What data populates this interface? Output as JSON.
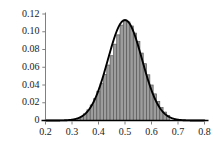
{
  "chart_data": {
    "type": "bar",
    "title": "",
    "subtitle": "",
    "xlabel": "",
    "ylabel": "",
    "xlim": [
      0.2,
      0.8
    ],
    "ylim": [
      0.0,
      0.12
    ],
    "grid": false,
    "legend": null,
    "xticks": [
      0.2,
      0.3,
      0.4,
      0.5,
      0.6,
      0.7,
      0.8
    ],
    "xtick_labels": [
      "0.2",
      "0.3",
      "0.4",
      "0.5",
      "0.6",
      "0.7",
      "0.8"
    ],
    "yticks": [
      0.0,
      0.02,
      0.04,
      0.06,
      0.08,
      0.1,
      0.12
    ],
    "ytick_labels": [
      "0",
      "0.02",
      "0.04",
      "0.06",
      "0.08",
      "0.10",
      "0.12"
    ],
    "bar_fill_color": "#9d9d9d",
    "bar_edge_color": "#595959",
    "curve_color": "#000000",
    "axis_color": "#808080",
    "baseline_color": "#000000",
    "bin_width": 0.0125,
    "bins": [
      {
        "x": 0.325,
        "value": 0.0025
      },
      {
        "x": 0.3375,
        "value": 0.0045
      },
      {
        "x": 0.35,
        "value": 0.0075
      },
      {
        "x": 0.3625,
        "value": 0.012
      },
      {
        "x": 0.375,
        "value": 0.0175
      },
      {
        "x": 0.3875,
        "value": 0.0245
      },
      {
        "x": 0.4,
        "value": 0.033
      },
      {
        "x": 0.4125,
        "value": 0.042
      },
      {
        "x": 0.425,
        "value": 0.052
      },
      {
        "x": 0.4375,
        "value": 0.0625
      },
      {
        "x": 0.45,
        "value": 0.073
      },
      {
        "x": 0.4625,
        "value": 0.086
      },
      {
        "x": 0.475,
        "value": 0.0965
      },
      {
        "x": 0.4875,
        "value": 0.1075
      },
      {
        "x": 0.5,
        "value": 0.112
      },
      {
        "x": 0.5125,
        "value": 0.111
      },
      {
        "x": 0.525,
        "value": 0.1065
      },
      {
        "x": 0.5375,
        "value": 0.0985
      },
      {
        "x": 0.55,
        "value": 0.089
      },
      {
        "x": 0.5625,
        "value": 0.076
      },
      {
        "x": 0.575,
        "value": 0.064
      },
      {
        "x": 0.5875,
        "value": 0.0515
      },
      {
        "x": 0.6,
        "value": 0.04
      },
      {
        "x": 0.6125,
        "value": 0.03
      },
      {
        "x": 0.625,
        "value": 0.0215
      },
      {
        "x": 0.6375,
        "value": 0.0145
      },
      {
        "x": 0.65,
        "value": 0.0095
      },
      {
        "x": 0.6625,
        "value": 0.0055
      }
    ],
    "curve": {
      "kind": "normal-density",
      "mean": 0.5,
      "sigma": 0.0645,
      "peak": 0.1132,
      "scale": 0.01832
    }
  }
}
